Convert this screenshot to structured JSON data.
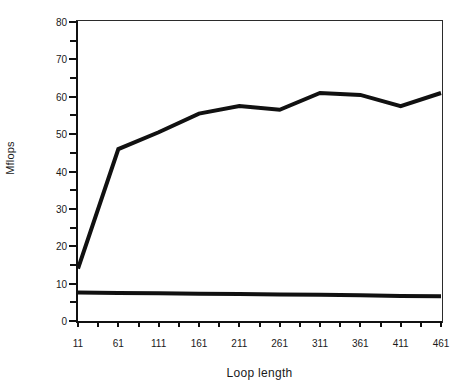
{
  "chart_data": {
    "type": "line",
    "title": "",
    "xlabel": "Loop length",
    "ylabel": "Mflops",
    "xlim": [
      11,
      461
    ],
    "ylim": [
      0,
      80
    ],
    "grid": false,
    "legend_position": "inline-end-of-line",
    "x": [
      11,
      61,
      111,
      161,
      211,
      261,
      311,
      361,
      411,
      461
    ],
    "y_ticks": [
      0,
      10,
      20,
      30,
      40,
      50,
      60,
      70,
      80
    ],
    "y_minor_step": 5,
    "x_tick_labels": [
      "11",
      "61",
      "111",
      "161",
      "211",
      "261",
      "311",
      "361",
      "411",
      "461"
    ],
    "x_minor_step": 25,
    "series": [
      {
        "name": "a",
        "label": "a",
        "color": "#111111",
        "linewidth": 4,
        "values": [
          7.6,
          7.5,
          7.4,
          7.3,
          7.2,
          7.1,
          7.0,
          6.9,
          6.7,
          6.6
        ]
      },
      {
        "name": "b",
        "label": "b",
        "color": "#111111",
        "linewidth": 4,
        "values": [
          14.0,
          46.0,
          50.5,
          55.5,
          57.5,
          56.5,
          61.0,
          60.5,
          57.5,
          61.0
        ]
      }
    ],
    "annotations": [
      {
        "text": "b",
        "x": 461,
        "y": 67,
        "series": "b"
      },
      {
        "text": "a",
        "x": 461,
        "y": 11,
        "series": "a"
      }
    ]
  },
  "axes": {
    "y_title": "Mflops",
    "x_title": "Loop length",
    "y_tick_labels": [
      "0",
      "10",
      "20",
      "30",
      "40",
      "50",
      "60",
      "70",
      "80"
    ],
    "x_tick_labels": [
      "11",
      "61",
      "111",
      "161",
      "211",
      "261",
      "311",
      "361",
      "411",
      "461"
    ]
  },
  "colors": {
    "axis": "#111111",
    "frame": "#2b2b2b",
    "series": "#111111",
    "background": "#ffffff",
    "text": "#1a1a1a"
  }
}
